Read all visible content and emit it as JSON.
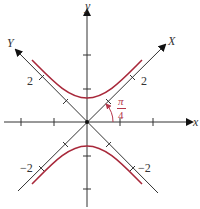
{
  "diagram": {
    "axes": {
      "x_label": "x",
      "y_label": "y",
      "X_label": "X",
      "Y_label": "Y"
    },
    "tick_labels": {
      "upper_left": "2",
      "upper_right": "2",
      "lower_left": "−2",
      "lower_right": "−2"
    },
    "angle": {
      "numerator": "π",
      "denominator": "4"
    },
    "colors": {
      "axis": "#333333",
      "curve": "#a8283a",
      "angle": "#b5364a"
    }
  }
}
